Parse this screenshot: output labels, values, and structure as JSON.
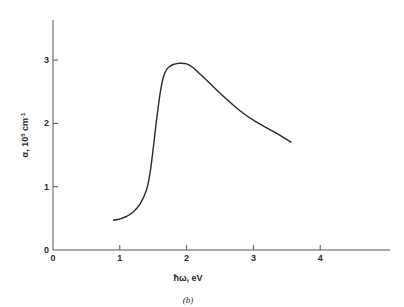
{
  "chart_data": {
    "type": "line",
    "title": "",
    "caption": "(b)",
    "xlabel": "ħω, eV",
    "ylabel": "α, 10⁵ cm⁻¹",
    "ylabel_parts": {
      "symbol": "α, 10",
      "exp1": "5",
      "unit": " cm",
      "exp2": "-1"
    },
    "xlim": [
      0,
      5
    ],
    "ylim": [
      0,
      3.6
    ],
    "xticks": [
      0,
      1,
      2,
      3,
      4
    ],
    "yticks": [
      0,
      1,
      2,
      3
    ],
    "xtick_labels": [
      "0",
      "1",
      "2",
      "3",
      "4"
    ],
    "ytick_labels": [
      "0",
      "1",
      "2",
      "3"
    ],
    "grid": false,
    "legend": null,
    "series": [
      {
        "name": "absorption coefficient",
        "x": [
          0.9,
          1.0,
          1.1,
          1.2,
          1.3,
          1.4,
          1.45,
          1.5,
          1.55,
          1.6,
          1.65,
          1.7,
          1.75,
          1.8,
          1.9,
          2.0,
          2.1,
          2.2,
          2.4,
          2.6,
          2.8,
          3.0,
          3.2,
          3.4,
          3.57
        ],
        "y": [
          0.47,
          0.49,
          0.53,
          0.6,
          0.72,
          0.95,
          1.2,
          1.6,
          2.05,
          2.45,
          2.72,
          2.85,
          2.9,
          2.93,
          2.95,
          2.94,
          2.88,
          2.78,
          2.58,
          2.38,
          2.2,
          2.05,
          1.93,
          1.81,
          1.7
        ]
      }
    ]
  },
  "colors": {
    "line": "#2b2b2b",
    "axis": "#555555",
    "background": "#ffffff"
  }
}
